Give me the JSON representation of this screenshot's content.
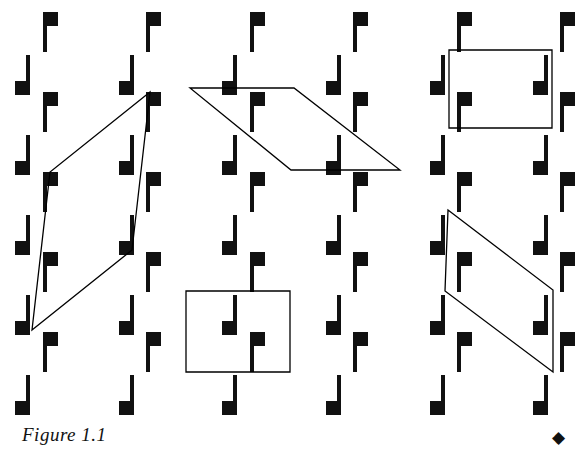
{
  "figure": {
    "caption": "Figure 1.1",
    "end_marker": "◆",
    "end_marker_icon": "filled-diamond-icon",
    "width": 577,
    "height": 467,
    "background_color": "#ffffff",
    "ink_color": "#111111",
    "stroke_color": "#000000",
    "line_width": 1.3
  },
  "motif": {
    "up": {
      "name": "up-flag-glyph",
      "description": "solid square banner at top attached to right side of a vertical pole descending below",
      "banner_w": 15,
      "banner_h": 14,
      "pole_w": 4,
      "pole_h": 30,
      "color": "#111111"
    },
    "down": {
      "name": "down-flag-glyph",
      "description": "solid square banner at bottom attached to left side of a vertical pole ascending above",
      "banner_w": 15,
      "banner_h": 14,
      "pole_w": 4,
      "pole_h": 30,
      "color": "#111111"
    }
  },
  "lattice": {
    "description": "wallpaper pattern of alternating up-flag and down-flag rows",
    "up_rows_y": [
      12,
      92,
      172,
      252,
      332
    ],
    "up_cols_x": [
      43,
      146,
      250,
      353,
      457,
      560
    ],
    "down_rows_y": [
      55,
      135,
      215,
      295,
      375
    ],
    "down_cols_x": [
      15,
      119,
      222,
      326,
      430,
      533
    ],
    "col_spacing": 103.5,
    "row_spacing": 80,
    "row_offset_x": 28
  },
  "regions": [
    {
      "name": "left-parallelogram",
      "shape": "parallelogram",
      "points": "150,92 132,250 32,330 50,172",
      "label": "slanted cell at left"
    },
    {
      "name": "center-parallelogram",
      "shape": "parallelogram",
      "points": "190,88 294,88 400,170 291,170",
      "label": "wide slanted cell at center top"
    },
    {
      "name": "top-right-rectangle",
      "shape": "rectangle",
      "points": "449,50 552,50 552,128 449,128",
      "label": "upright cell at top right"
    },
    {
      "name": "bottom-center-rectangle",
      "shape": "rectangle",
      "points": "186,291 290,291 290,372 186,372",
      "label": "upright cell at bottom center"
    },
    {
      "name": "bottom-right-parallelogram",
      "shape": "parallelogram",
      "points": "448,210 553,290 553,372 445,291",
      "label": "slanted cell at bottom right"
    }
  ]
}
